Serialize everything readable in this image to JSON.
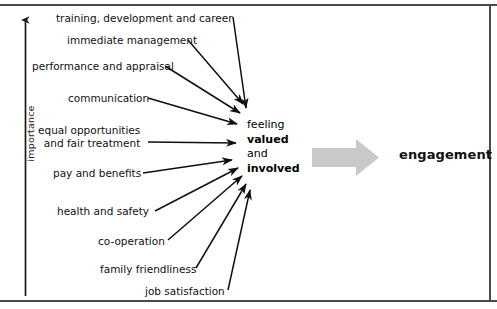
{
  "diagram": {
    "title_hidden": "",
    "axis": {
      "label": "importance",
      "icon": "up-arrow-icon"
    },
    "frame_color": "#4a4a4a",
    "factors": [
      {
        "label": "training, development and career",
        "x": 56,
        "y": 12,
        "lines": [
          "training, development and career"
        ]
      },
      {
        "label": "immediate management",
        "x": 67,
        "y": 34,
        "lines": [
          "immediate management"
        ]
      },
      {
        "label": "performance and appraisal",
        "x": 32,
        "y": 60,
        "lines": [
          "performance and appraisal"
        ]
      },
      {
        "label": "communication",
        "x": 68,
        "y": 92,
        "lines": [
          "communication"
        ]
      },
      {
        "label": "equal opportunities and fair treatment",
        "x": 38,
        "y": 124,
        "lines": [
          "equal opportunities",
          "and fair treatment"
        ]
      },
      {
        "label": "pay and benefits",
        "x": 53,
        "y": 167,
        "lines": [
          "pay and benefits"
        ]
      },
      {
        "label": "health and safety",
        "x": 57,
        "y": 205,
        "lines": [
          "health and safety"
        ]
      },
      {
        "label": "co-operation",
        "x": 98,
        "y": 235,
        "lines": [
          "co-operation"
        ]
      },
      {
        "label": "family friendliness",
        "x": 100,
        "y": 263,
        "lines": [
          "family friendliness"
        ]
      },
      {
        "label": "job satisfaction",
        "x": 145,
        "y": 285,
        "lines": [
          "job satisfaction"
        ]
      }
    ],
    "outcome": {
      "line1": "feeling",
      "line2": "valued",
      "line3": "and",
      "line4": "involved"
    },
    "flow_arrow": {
      "icon": "right-block-arrow-icon",
      "color": "#c9c9c9"
    },
    "result": {
      "label": "engagement"
    },
    "connectors": [
      {
        "from": "training, development and career",
        "x1": 233,
        "y1": 17,
        "x2": 246,
        "y2": 108
      },
      {
        "from": "immediate management",
        "x1": 188,
        "y1": 40,
        "x2": 243,
        "y2": 104
      },
      {
        "from": "performance and appraisal",
        "x1": 165,
        "y1": 66,
        "x2": 240,
        "y2": 113
      },
      {
        "from": "communication",
        "x1": 148,
        "y1": 98,
        "x2": 237,
        "y2": 124
      },
      {
        "from": "equal opportunities and fair treatment",
        "x1": 148,
        "y1": 142,
        "x2": 236,
        "y2": 143
      },
      {
        "from": "pay and benefits",
        "x1": 143,
        "y1": 173,
        "x2": 232,
        "y2": 160
      },
      {
        "from": "health and safety",
        "x1": 155,
        "y1": 211,
        "x2": 238,
        "y2": 168
      },
      {
        "from": "co-operation",
        "x1": 168,
        "y1": 240,
        "x2": 242,
        "y2": 176
      },
      {
        "from": "family friendliness",
        "x1": 196,
        "y1": 268,
        "x2": 246,
        "y2": 184
      },
      {
        "from": "job satisfaction",
        "x1": 228,
        "y1": 290,
        "x2": 250,
        "y2": 190
      }
    ]
  }
}
